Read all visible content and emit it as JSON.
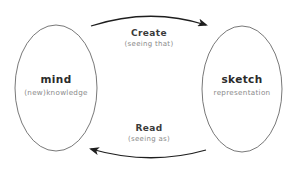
{
  "diagram": {
    "nodes": [
      {
        "id": "mind",
        "title": "mind",
        "subtitle": "(new)knowledge"
      },
      {
        "id": "sketch",
        "title": "sketch",
        "subtitle": "representation"
      }
    ],
    "edges": [
      {
        "from": "mind",
        "to": "sketch",
        "label": "Create",
        "sublabel": "(seeing that)"
      },
      {
        "from": "sketch",
        "to": "mind",
        "label": "Read",
        "sublabel": "(seeing as)"
      }
    ]
  },
  "colors": {
    "stroke": "#3a3a3a",
    "title_text": "#2b2b2b",
    "subtitle_text": "#8a8a8a",
    "background": "#ffffff"
  }
}
